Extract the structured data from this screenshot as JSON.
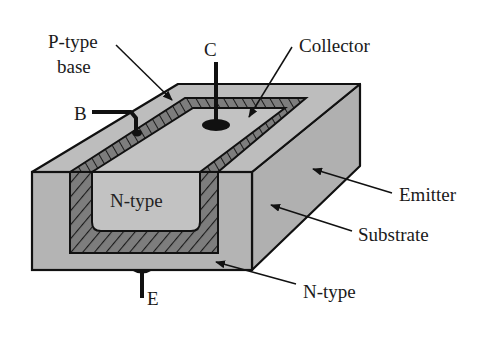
{
  "figure": {
    "labels": {
      "p_type_base_line1": "P-type",
      "p_type_base_line2": "base",
      "collector_terminal": "C",
      "collector": "Collector",
      "base_terminal": "B",
      "n_type_inner": "N-type",
      "emitter": "Emitter",
      "substrate": "Substrate",
      "n_type_bottom": "N-type",
      "emitter_terminal": "E"
    },
    "colors": {
      "substrate_fill": "#b4b4b4",
      "base_fill": "#7d7d7d",
      "collector_fill": "#c2c2c2",
      "outline": "#111111",
      "background": "#ffffff"
    }
  }
}
